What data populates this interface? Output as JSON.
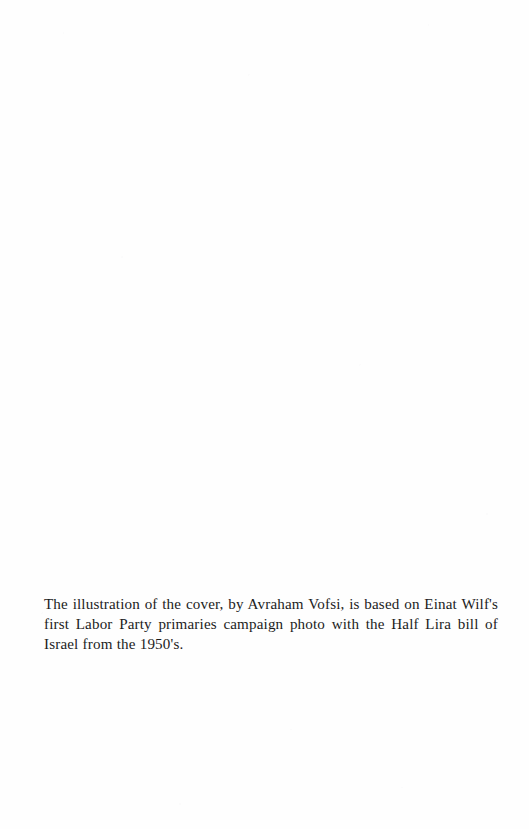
{
  "page": {
    "kind": "book-colophon-page",
    "background_color": "#fefefe",
    "text_color": "#1c1c1c",
    "width": 529,
    "height": 829
  },
  "credit": {
    "paragraph": "The illustration of the cover, by Avraham Vofsi, is based on Einat Wilf's first Labor Party primaries campaign photo with the Half Lira bill of Israel from the 1950's.",
    "lines": [
      "The illustration of the cover, by Avraham Vofsi, is based on Einat",
      "Wilf's first Labor Party primaries campaign photo with the Half",
      "Lira bill of Israel from the 1950's."
    ],
    "mentioned_names": {
      "illustrator": "Avraham Vofsi",
      "subject": "Einat Wilf"
    },
    "mentioned_entities": {
      "party": "Labor Party",
      "currency_note": "Half Lira bill of Israel",
      "decade": "1950's"
    }
  }
}
